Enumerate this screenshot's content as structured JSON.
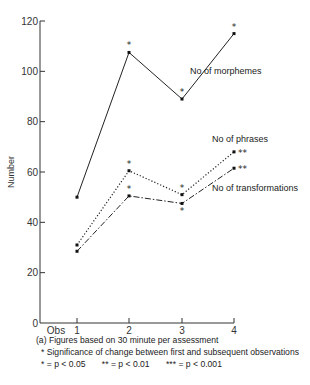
{
  "chart_data": {
    "type": "line",
    "title": "",
    "xlabel": "",
    "ylabel": "Number",
    "ylim": [
      0,
      120
    ],
    "yticks": [
      0,
      20,
      40,
      60,
      80,
      100,
      120
    ],
    "x_origin_label": "Obs",
    "categories": [
      "1",
      "2",
      "3",
      "4"
    ],
    "grid": false,
    "series": [
      {
        "name": "No of morphemes",
        "style": "solid",
        "values": [
          50,
          107.5,
          89,
          115
        ],
        "significance": [
          "",
          "*",
          "*",
          "*"
        ]
      },
      {
        "name": "No of phrases",
        "style": "dotted",
        "values": [
          31,
          60.5,
          51,
          68
        ],
        "significance": [
          "",
          "*",
          "*",
          "**"
        ]
      },
      {
        "name": "No of transformations",
        "style": "dashed",
        "values": [
          28.5,
          50.5,
          47.5,
          61.5
        ],
        "significance": [
          "",
          "*",
          "*",
          "**"
        ]
      }
    ],
    "notes": [
      "(a) Figures based on 30 minute per assessment",
      "* Significance of change between first and subsequent observations"
    ],
    "significance_legend": [
      "* = p < 0.05",
      "** = p < 0.01",
      "*** = p < 0.001"
    ]
  }
}
